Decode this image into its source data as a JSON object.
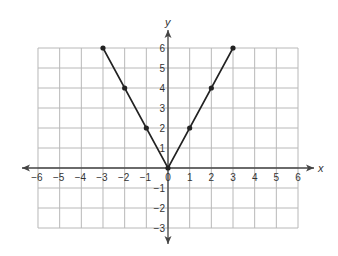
{
  "chart_data": {
    "type": "line",
    "title": "",
    "xlabel": "x",
    "ylabel": "y",
    "xlim": [
      -6,
      6
    ],
    "ylim": [
      -3,
      6
    ],
    "grid": true,
    "x_ticks": [
      -6,
      -5,
      -4,
      -3,
      -2,
      -1,
      0,
      1,
      2,
      3,
      4,
      5,
      6
    ],
    "y_ticks": [
      -3,
      -2,
      -1,
      1,
      2,
      3,
      4,
      5,
      6
    ],
    "x_tick_labels": [
      "−6",
      "−5",
      "−4",
      "−3",
      "−2",
      "−1",
      "0",
      "1",
      "2",
      "3",
      "4",
      "5",
      "6"
    ],
    "y_tick_labels": [
      "−3",
      "−2",
      "−1",
      "1",
      "2",
      "3",
      "4",
      "5",
      "6"
    ],
    "series": [
      {
        "name": "y = 2|x|",
        "x": [
          -3,
          -2,
          -1,
          0,
          1,
          2,
          3
        ],
        "y": [
          6,
          4,
          2,
          0,
          2,
          4,
          6
        ],
        "markers": true
      }
    ]
  },
  "colors": {
    "grid": "#b8b8b8",
    "axis": "#444444",
    "line": "#222222",
    "text": "#333333"
  }
}
